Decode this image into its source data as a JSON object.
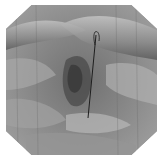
{
  "image": {
    "description": "Grayscale endoscopic illustration of tissue folds with a thin wire/suture",
    "frame_shape": "octagon",
    "colors": {
      "background": "#ffffff",
      "tissue_base": "#8c8c8c",
      "highlight": "#c8c8c8",
      "shadow": "#4a4a4a",
      "wire": "#1e1e1e"
    },
    "wire": {
      "top": [
        95,
        32
      ],
      "bottom": [
        88,
        118
      ]
    }
  }
}
